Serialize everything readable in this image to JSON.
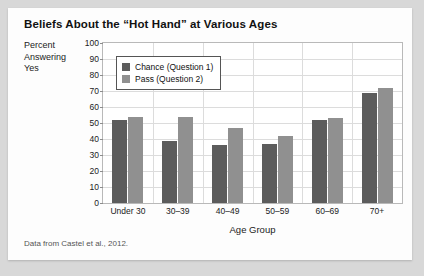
{
  "card": {
    "title": "Beliefs About the “Hot Hand” at Various Ages",
    "source_note": "Data from Castel et al., 2012."
  },
  "chart_data": {
    "type": "bar",
    "title": "Beliefs About the “Hot Hand” at Various Ages",
    "xlabel": "Age Group",
    "ylabel": "Percent Answering Yes",
    "ylabel_lines": [
      "Percent",
      "Answering",
      "Yes"
    ],
    "categories": [
      "Under 30",
      "30–39",
      "40–49",
      "50–59",
      "60–69",
      "70+"
    ],
    "series": [
      {
        "name": "Chance (Question 1)",
        "color": "#5c5c5c",
        "values": [
          52,
          39,
          36,
          37,
          52,
          69
        ]
      },
      {
        "name": "Pass (Question 2)",
        "color": "#909090",
        "values": [
          54,
          54,
          47,
          42,
          53,
          72
        ]
      }
    ],
    "ylim": [
      0,
      100
    ],
    "yticks": [
      0,
      10,
      20,
      30,
      40,
      50,
      60,
      70,
      80,
      90,
      100
    ],
    "grid": true,
    "legend_position": "upper-left-inside"
  }
}
